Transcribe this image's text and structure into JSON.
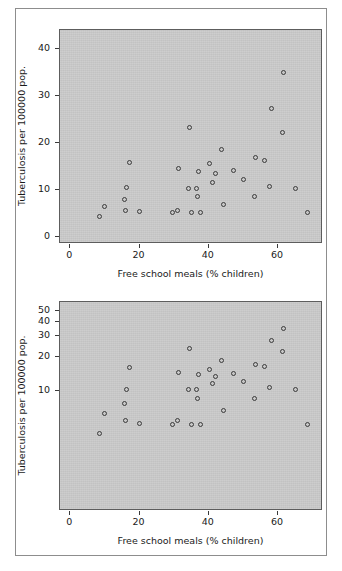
{
  "figure": {
    "background_color": "#ffffff",
    "frame_color": "#8d8d8d",
    "plot_background_color": "#c9c9c9",
    "marker_color": "#3b3b3b"
  },
  "chart_data": [
    {
      "type": "scatter",
      "panel": "top",
      "title": "",
      "xlabel": "Free school meals (% children)",
      "ylabel": "Tuberculosis per 100000 pop.",
      "xscale": "linear",
      "yscale": "linear",
      "xlim": [
        -3,
        73
      ],
      "ylim": [
        -1.5,
        44
      ],
      "xticks": [
        0,
        20,
        40,
        60
      ],
      "xticklabels": [
        "0",
        "20",
        "40",
        "60"
      ],
      "yticks": [
        0,
        10,
        20,
        30,
        40
      ],
      "yticklabels": [
        "0",
        "10",
        "20",
        "30",
        "40"
      ],
      "grid": false,
      "legend": "none",
      "points": [
        {
          "x": 8.8,
          "y": 4.2
        },
        {
          "x": 10.2,
          "y": 6.3
        },
        {
          "x": 15.8,
          "y": 7.7
        },
        {
          "x": 16.6,
          "y": 10.2
        },
        {
          "x": 16.3,
          "y": 5.4
        },
        {
          "x": 17.5,
          "y": 15.7
        },
        {
          "x": 20.4,
          "y": 5.1
        },
        {
          "x": 29.8,
          "y": 5.0
        },
        {
          "x": 31.1,
          "y": 5.4
        },
        {
          "x": 31.6,
          "y": 14.4
        },
        {
          "x": 34.6,
          "y": 23.1
        },
        {
          "x": 34.3,
          "y": 10.1
        },
        {
          "x": 35.2,
          "y": 5.0
        },
        {
          "x": 36.8,
          "y": 10.1
        },
        {
          "x": 37.0,
          "y": 8.4
        },
        {
          "x": 37.4,
          "y": 13.6
        },
        {
          "x": 37.9,
          "y": 5.0
        },
        {
          "x": 40.6,
          "y": 15.3
        },
        {
          "x": 41.5,
          "y": 11.4
        },
        {
          "x": 42.2,
          "y": 13.2
        },
        {
          "x": 43.9,
          "y": 18.3
        },
        {
          "x": 44.4,
          "y": 6.6
        },
        {
          "x": 47.5,
          "y": 13.9
        },
        {
          "x": 50.3,
          "y": 11.9
        },
        {
          "x": 53.4,
          "y": 8.4
        },
        {
          "x": 53.7,
          "y": 16.7
        },
        {
          "x": 56.5,
          "y": 16.1
        },
        {
          "x": 57.7,
          "y": 10.6
        },
        {
          "x": 58.4,
          "y": 27.1
        },
        {
          "x": 61.6,
          "y": 21.9
        },
        {
          "x": 61.9,
          "y": 34.7
        },
        {
          "x": 65.3,
          "y": 10.1
        },
        {
          "x": 68.8,
          "y": 5.0
        }
      ]
    },
    {
      "type": "scatter",
      "panel": "bottom",
      "title": "",
      "xlabel": "Free school meals (% children)",
      "ylabel": "Tuberculosis per 100000 pop.",
      "xscale": "linear",
      "yscale": "log",
      "xlim": [
        -3,
        73
      ],
      "ylim": [
        0.9,
        60
      ],
      "xticks": [
        0,
        20,
        40,
        60
      ],
      "xticklabels": [
        "0",
        "20",
        "40",
        "60"
      ],
      "yticks": [
        10,
        20,
        30,
        40,
        50
      ],
      "yticklabels": [
        "10",
        "20",
        "30",
        "40",
        "50"
      ],
      "grid": false,
      "legend": "none",
      "points": [
        {
          "x": 8.8,
          "y": 4.2
        },
        {
          "x": 10.2,
          "y": 6.3
        },
        {
          "x": 15.8,
          "y": 7.7
        },
        {
          "x": 16.6,
          "y": 10.2
        },
        {
          "x": 16.3,
          "y": 5.4
        },
        {
          "x": 17.5,
          "y": 15.7
        },
        {
          "x": 20.4,
          "y": 5.1
        },
        {
          "x": 29.8,
          "y": 5.0
        },
        {
          "x": 31.1,
          "y": 5.4
        },
        {
          "x": 31.6,
          "y": 14.4
        },
        {
          "x": 34.6,
          "y": 23.1
        },
        {
          "x": 34.3,
          "y": 10.1
        },
        {
          "x": 35.2,
          "y": 5.0
        },
        {
          "x": 36.8,
          "y": 10.1
        },
        {
          "x": 37.0,
          "y": 8.4
        },
        {
          "x": 37.4,
          "y": 13.6
        },
        {
          "x": 37.9,
          "y": 5.0
        },
        {
          "x": 40.6,
          "y": 15.3
        },
        {
          "x": 41.5,
          "y": 11.4
        },
        {
          "x": 42.2,
          "y": 13.2
        },
        {
          "x": 43.9,
          "y": 18.3
        },
        {
          "x": 44.4,
          "y": 6.6
        },
        {
          "x": 47.5,
          "y": 13.9
        },
        {
          "x": 50.3,
          "y": 11.9
        },
        {
          "x": 53.4,
          "y": 8.4
        },
        {
          "x": 53.7,
          "y": 16.7
        },
        {
          "x": 56.5,
          "y": 16.1
        },
        {
          "x": 57.7,
          "y": 10.6
        },
        {
          "x": 58.4,
          "y": 27.1
        },
        {
          "x": 61.6,
          "y": 21.9
        },
        {
          "x": 61.9,
          "y": 34.7
        },
        {
          "x": 65.3,
          "y": 10.1
        },
        {
          "x": 68.8,
          "y": 5.0
        }
      ]
    }
  ]
}
